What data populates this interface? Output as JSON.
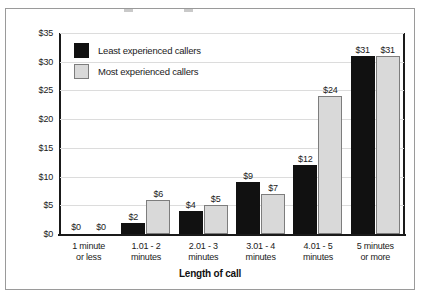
{
  "chart_data": {
    "type": "bar",
    "title": "",
    "xlabel": "Length of call",
    "ylabel": "",
    "ylim": [
      0,
      35
    ],
    "ytick_labels": [
      "$0",
      "$5",
      "$10",
      "$15",
      "$20",
      "$25",
      "$30",
      "$35"
    ],
    "ytick_values": [
      0,
      5,
      10,
      15,
      20,
      25,
      30,
      35
    ],
    "grid": true,
    "legend_position": "top-left",
    "categories": [
      "1 minute or less",
      "1.01 - 2 minutes",
      "2.01 - 3 minutes",
      "3.01 - 4 minutes",
      "4.01 - 5 minutes",
      "5 minutes or more"
    ],
    "category_lines": [
      [
        "1 minute",
        "or less"
      ],
      [
        "1.01 - 2",
        "minutes"
      ],
      [
        "2.01 - 3",
        "minutes"
      ],
      [
        "3.01 - 4",
        "minutes"
      ],
      [
        "4.01 - 5",
        "minutes"
      ],
      [
        "5 minutes",
        "or more"
      ]
    ],
    "series": [
      {
        "name": "Least experienced callers",
        "color": "#111111",
        "values": [
          0,
          2,
          4,
          9,
          12,
          31
        ],
        "labels": [
          "$0",
          "$2",
          "$4",
          "$9",
          "$12",
          "$31"
        ]
      },
      {
        "name": "Most experienced callers",
        "color": "#d9d9d9",
        "values": [
          0,
          6,
          5,
          7,
          24,
          31
        ],
        "labels": [
          "$0",
          "$6",
          "$5",
          "$7",
          "$24",
          "$31"
        ]
      }
    ]
  },
  "legend": {
    "items": [
      {
        "label": "Least experienced callers"
      },
      {
        "label": "Most experienced callers"
      }
    ]
  }
}
